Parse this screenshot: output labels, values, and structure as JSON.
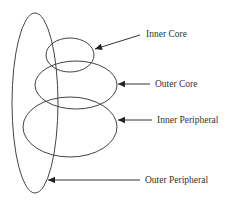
{
  "diagram": {
    "type": "nested-ellipses",
    "background": "#ffffff",
    "stroke_color": "#444444",
    "layers": [
      {
        "id": "inner-core",
        "label": "Inner Core",
        "ellipse": {
          "cx": 70,
          "cy": 55,
          "rx": 24,
          "ry": 17
        },
        "arrow": {
          "x1": 140,
          "y1": 35,
          "x2": 95,
          "y2": 49
        },
        "label_pos": {
          "x": 146,
          "y": 37
        }
      },
      {
        "id": "outer-core",
        "label": "Outer Core",
        "ellipse": {
          "cx": 76,
          "cy": 85,
          "rx": 41,
          "ry": 24
        },
        "arrow": {
          "x1": 150,
          "y1": 84,
          "x2": 118,
          "y2": 84
        },
        "label_pos": {
          "x": 155,
          "y": 87
        }
      },
      {
        "id": "inner-peripheral",
        "label": "Inner Peripheral",
        "ellipse": {
          "cx": 70,
          "cy": 127,
          "rx": 47,
          "ry": 30
        },
        "arrow": {
          "x1": 152,
          "y1": 120,
          "x2": 118,
          "y2": 120
        },
        "label_pos": {
          "x": 157,
          "y": 123
        }
      },
      {
        "id": "outer-peripheral",
        "label": "Outer Peripheral",
        "ellipse": {
          "cx": 35,
          "cy": 103,
          "rx": 23,
          "ry": 90
        },
        "arrow": {
          "x1": 140,
          "y1": 180,
          "x2": 48,
          "y2": 180
        },
        "label_pos": {
          "x": 145,
          "y": 183
        }
      }
    ]
  }
}
